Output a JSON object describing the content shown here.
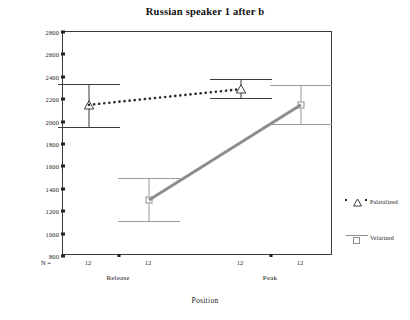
{
  "chart_data": {
    "type": "line",
    "title": "Russian speaker 1 after b",
    "xlabel": "Position",
    "ylabel": "F2 Prime",
    "ylim": [
      800,
      2800
    ],
    "ytick_step": 200,
    "yticks": [
      "2800",
      "2600",
      "2400",
      "2200",
      "2000",
      "1800",
      "1600",
      "1400",
      "1200",
      "1000",
      "800"
    ],
    "categories": [
      "Release",
      "Peak"
    ],
    "grid": false,
    "legend_position": "right",
    "n_prefix": "N =",
    "n_values": [
      "12",
      "12",
      "12",
      "12"
    ],
    "series": [
      {
        "name": "Palatalized",
        "marker": "triangle",
        "line_style": "dotted",
        "color": "#2b2b2b",
        "values": [
          2150,
          2290
        ],
        "ci_upper": [
          2340,
          2380
        ],
        "ci_lower": [
          1950,
          2210
        ]
      },
      {
        "name": "Velarized",
        "marker": "square",
        "line_style": "solid",
        "color": "#8d8d8d",
        "values": [
          1300,
          2150
        ],
        "ci_upper": [
          1500,
          2330
        ],
        "ci_lower": [
          1110,
          1980
        ]
      }
    ]
  },
  "legend": {
    "items": [
      {
        "label": "Palatalized"
      },
      {
        "label": "Velarized"
      }
    ]
  }
}
